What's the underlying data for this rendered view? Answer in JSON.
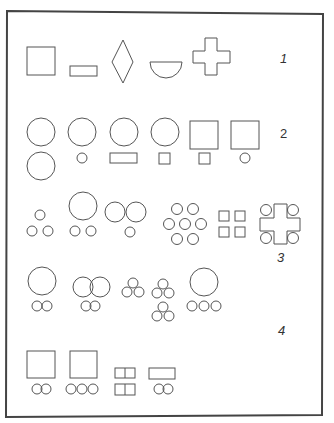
{
  "figure": {
    "colors": {
      "stroke": "#555555",
      "frame": "#444444",
      "background": "#ffffff"
    },
    "row_labels": [
      "1",
      "2",
      "3",
      "4"
    ],
    "rows": [
      {
        "label": "1",
        "items": [
          "square",
          "rectangle",
          "diamond",
          "half-circle",
          "cross"
        ]
      },
      {
        "label": "2",
        "items": [
          "circle over circle",
          "circle over small circle",
          "circle over rectangle",
          "circle over small square",
          "square over small square",
          "square over small circle"
        ]
      },
      {
        "label": "3",
        "items": [
          "three small circles (triangle)",
          "large circle over two small circles",
          "two circles over small circle",
          "seven small circles (hexagonal)",
          "four small squares",
          "cross with four corner circles"
        ]
      },
      {
        "label": "4",
        "items": [
          "large circle over two linked circles",
          "two overlapping circles over two linked circles",
          "trefoil of circles",
          "two stacked trefoils",
          "large circle over three small circles",
          "square over two linked circles",
          "square over three circles",
          "two split rectangles stacked",
          "rectangle over two linked circles"
        ]
      }
    ]
  }
}
